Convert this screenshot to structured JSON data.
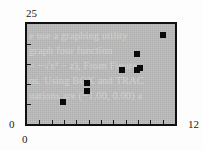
{
  "figure": {
    "name": "scatter-plot-figure",
    "background_color": "#fdfdfd",
    "plot_background_color": "#b9b9b9",
    "frame_color": "#101010",
    "marker_color": "#0a0a0a"
  },
  "axes": {
    "y_max_label": "25",
    "y_min_label": "0",
    "x_min_label": "0",
    "x_max_label": "12",
    "x_tick_count": 11,
    "y_tick_count": 4
  },
  "ghost_text": {
    "color": "#cfcfcf",
    "lines": [
      "e use a graphing utility",
      "graph  four  function",
      "= −√x² − z), From Figure",
      "ns. Using BOX and TRAC",
      "uations are (−1.00, 0.00) a"
    ]
  },
  "chart_data": {
    "type": "scatter",
    "title": "",
    "xlabel": "",
    "ylabel": "",
    "xlim": [
      0,
      12
    ],
    "ylim": [
      0,
      25
    ],
    "grid": false,
    "legend": null,
    "series": [
      {
        "name": "data",
        "marker": "filled-square",
        "color": "#0a0a0a",
        "points": [
          {
            "x": 2.9,
            "y": 5.5
          },
          {
            "x": 4.9,
            "y": 10.3
          },
          {
            "x": 4.9,
            "y": 8.2
          },
          {
            "x": 7.7,
            "y": 13.4
          },
          {
            "x": 8.9,
            "y": 17.4
          },
          {
            "x": 9.2,
            "y": 13.9
          },
          {
            "x": 11.0,
            "y": 22.2
          },
          {
            "x": 8.9,
            "y": 13.6
          }
        ]
      }
    ]
  }
}
